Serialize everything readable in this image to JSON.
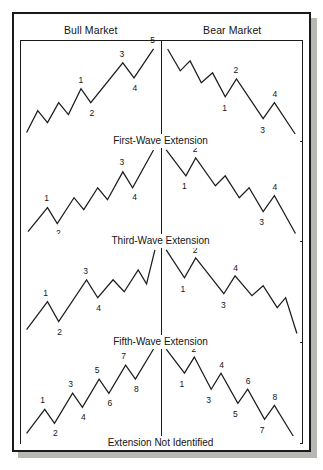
{
  "figure": {
    "columns": [
      {
        "id": "bull",
        "label": "Bull Market"
      },
      {
        "id": "bear",
        "label": "Bear Market"
      }
    ],
    "rows": [
      {
        "id": "first-wave",
        "caption": "First-Wave Extension"
      },
      {
        "id": "third-wave",
        "caption": "Third-Wave Extension"
      },
      {
        "id": "fifth-wave",
        "caption": "Fifth-Wave Extension"
      },
      {
        "id": "not-identified",
        "caption": "Extension Not Identified"
      }
    ]
  },
  "colors": {
    "line": "#1d1d1d",
    "frame": "#1a1a1a",
    "background": "#ffffff",
    "shadow": "#b9b7b4",
    "text": "#141414"
  },
  "chart_data": [
    {
      "type": "line",
      "title": "First-Wave Extension — Bull Market",
      "xlabel": "",
      "ylabel": "",
      "xlim": [
        0,
        100
      ],
      "ylim": [
        0,
        100
      ],
      "grid": false,
      "legend": null,
      "points": [
        [
          4,
          8
        ],
        [
          12,
          30
        ],
        [
          19,
          18
        ],
        [
          27,
          38
        ],
        [
          34,
          26
        ],
        [
          43,
          52
        ],
        [
          50,
          38
        ],
        [
          73,
          78
        ],
        [
          81,
          63
        ],
        [
          95,
          92
        ]
      ],
      "annotations": [
        {
          "label": "1",
          "x": 43,
          "y": 52,
          "dx": 0,
          "dy": -9
        },
        {
          "label": "2",
          "x": 50,
          "y": 38,
          "dx": 1,
          "dy": 10
        },
        {
          "label": "3",
          "x": 73,
          "y": 78,
          "dx": -1,
          "dy": -9
        },
        {
          "label": "4",
          "x": 81,
          "y": 63,
          "dx": 1,
          "dy": 10
        },
        {
          "label": "5",
          "x": 95,
          "y": 92,
          "dx": -1,
          "dy": -9
        }
      ]
    },
    {
      "type": "line",
      "title": "First-Wave Extension — Bear Market",
      "xlabel": "",
      "ylabel": "",
      "xlim": [
        0,
        100
      ],
      "ylim": [
        0,
        100
      ],
      "grid": false,
      "legend": null,
      "points": [
        [
          4,
          92
        ],
        [
          13,
          70
        ],
        [
          20,
          80
        ],
        [
          28,
          58
        ],
        [
          36,
          68
        ],
        [
          45,
          44
        ],
        [
          53,
          62
        ],
        [
          72,
          22
        ],
        [
          80,
          38
        ],
        [
          95,
          6
        ]
      ],
      "annotations": [
        {
          "label": "1",
          "x": 45,
          "y": 44,
          "dx": 0,
          "dy": 11
        },
        {
          "label": "2",
          "x": 53,
          "y": 62,
          "dx": 0,
          "dy": -9
        },
        {
          "label": "3",
          "x": 72,
          "y": 22,
          "dx": 0,
          "dy": 11
        },
        {
          "label": "4",
          "x": 80,
          "y": 38,
          "dx": 1,
          "dy": -9
        },
        {
          "label": "5",
          "x": 95,
          "y": 6,
          "dx": 3,
          "dy": 11
        }
      ]
    },
    {
      "type": "line",
      "title": "Third-Wave Extension — Bull Market",
      "xlabel": "",
      "ylabel": "",
      "xlim": [
        0,
        100
      ],
      "ylim": [
        0,
        100
      ],
      "grid": false,
      "legend": null,
      "points": [
        [
          5,
          10
        ],
        [
          19,
          34
        ],
        [
          26,
          18
        ],
        [
          38,
          44
        ],
        [
          45,
          32
        ],
        [
          55,
          54
        ],
        [
          62,
          42
        ],
        [
          73,
          70
        ],
        [
          80,
          54
        ],
        [
          95,
          92
        ]
      ],
      "annotations": [
        {
          "label": "1",
          "x": 19,
          "y": 34,
          "dx": -1,
          "dy": -9
        },
        {
          "label": "2",
          "x": 26,
          "y": 18,
          "dx": 1,
          "dy": 10
        },
        {
          "label": "3",
          "x": 73,
          "y": 70,
          "dx": -1,
          "dy": -9
        },
        {
          "label": "4",
          "x": 80,
          "y": 54,
          "dx": 2,
          "dy": 10
        },
        {
          "label": "5",
          "x": 95,
          "y": 92,
          "dx": -2,
          "dy": -9
        }
      ]
    },
    {
      "type": "line",
      "title": "Third-Wave Extension — Bear Market",
      "xlabel": "",
      "ylabel": "",
      "xlim": [
        0,
        100
      ],
      "ylim": [
        0,
        100
      ],
      "grid": false,
      "legend": null,
      "points": [
        [
          3,
          92
        ],
        [
          17,
          66
        ],
        [
          24,
          84
        ],
        [
          38,
          56
        ],
        [
          45,
          66
        ],
        [
          55,
          44
        ],
        [
          62,
          54
        ],
        [
          72,
          30
        ],
        [
          80,
          46
        ],
        [
          95,
          8
        ]
      ],
      "annotations": [
        {
          "label": "1",
          "x": 17,
          "y": 66,
          "dx": -1,
          "dy": 11
        },
        {
          "label": "2",
          "x": 24,
          "y": 84,
          "dx": 0,
          "dy": -8
        },
        {
          "label": "3",
          "x": 72,
          "y": 30,
          "dx": -1,
          "dy": 11
        },
        {
          "label": "4",
          "x": 80,
          "y": 46,
          "dx": 1,
          "dy": -8
        },
        {
          "label": "5",
          "x": 95,
          "y": 8,
          "dx": 3,
          "dy": 11
        }
      ]
    },
    {
      "type": "line",
      "title": "Fifth-Wave Extension — Bull Market",
      "xlabel": "",
      "ylabel": "",
      "xlim": [
        0,
        100
      ],
      "ylim": [
        0,
        100
      ],
      "grid": false,
      "legend": null,
      "points": [
        [
          4,
          12
        ],
        [
          19,
          40
        ],
        [
          27,
          20
        ],
        [
          47,
          62
        ],
        [
          55,
          44
        ],
        [
          66,
          62
        ],
        [
          74,
          50
        ],
        [
          84,
          72
        ],
        [
          90,
          58
        ],
        [
          96,
          92
        ]
      ],
      "annotations": [
        {
          "label": "1",
          "x": 19,
          "y": 40,
          "dx": -2,
          "dy": -9
        },
        {
          "label": "2",
          "x": 27,
          "y": 20,
          "dx": 1,
          "dy": 10
        },
        {
          "label": "3",
          "x": 47,
          "y": 62,
          "dx": -1,
          "dy": -9
        },
        {
          "label": "4",
          "x": 55,
          "y": 44,
          "dx": 1,
          "dy": 10
        },
        {
          "label": "5",
          "x": 96,
          "y": 92,
          "dx": -2,
          "dy": -9
        }
      ]
    },
    {
      "type": "line",
      "title": "Fifth-Wave Extension — Bear Market",
      "xlabel": "",
      "ylabel": "",
      "xlim": [
        0,
        100
      ],
      "ylim": [
        0,
        100
      ],
      "grid": false,
      "legend": null,
      "points": [
        [
          3,
          92
        ],
        [
          16,
          64
        ],
        [
          24,
          84
        ],
        [
          44,
          48
        ],
        [
          52,
          66
        ],
        [
          64,
          46
        ],
        [
          72,
          56
        ],
        [
          82,
          34
        ],
        [
          88,
          44
        ],
        [
          96,
          8
        ]
      ],
      "annotations": [
        {
          "label": "1",
          "x": 16,
          "y": 64,
          "dx": -1,
          "dy": 11
        },
        {
          "label": "2",
          "x": 24,
          "y": 84,
          "dx": 0,
          "dy": -8
        },
        {
          "label": "3",
          "x": 44,
          "y": 48,
          "dx": 0,
          "dy": 11
        },
        {
          "label": "4",
          "x": 52,
          "y": 66,
          "dx": 1,
          "dy": -8
        },
        {
          "label": "5",
          "x": 96,
          "y": 8,
          "dx": 3,
          "dy": 11
        }
      ]
    },
    {
      "type": "line",
      "title": "Extension Not Identified — Bull Market",
      "xlabel": "",
      "ylabel": "",
      "xlim": [
        0,
        100
      ],
      "ylim": [
        0,
        100
      ],
      "grid": false,
      "legend": null,
      "points": [
        [
          4,
          10
        ],
        [
          17,
          34
        ],
        [
          24,
          20
        ],
        [
          37,
          50
        ],
        [
          44,
          36
        ],
        [
          56,
          64
        ],
        [
          63,
          50
        ],
        [
          75,
          78
        ],
        [
          82,
          64
        ],
        [
          95,
          94
        ]
      ],
      "annotations": [
        {
          "label": "1",
          "x": 17,
          "y": 34,
          "dx": -2,
          "dy": -9
        },
        {
          "label": "2",
          "x": 24,
          "y": 20,
          "dx": 1,
          "dy": 10
        },
        {
          "label": "3",
          "x": 37,
          "y": 50,
          "dx": -2,
          "dy": -9
        },
        {
          "label": "4",
          "x": 44,
          "y": 36,
          "dx": 1,
          "dy": 10
        },
        {
          "label": "5",
          "x": 56,
          "y": 64,
          "dx": -2,
          "dy": -9
        },
        {
          "label": "6",
          "x": 63,
          "y": 50,
          "dx": 1,
          "dy": 10
        },
        {
          "label": "7",
          "x": 75,
          "y": 78,
          "dx": -2,
          "dy": -9
        },
        {
          "label": "8",
          "x": 82,
          "y": 64,
          "dx": 1,
          "dy": 10
        },
        {
          "label": "9",
          "x": 95,
          "y": 94,
          "dx": -2,
          "dy": -8
        }
      ]
    },
    {
      "type": "line",
      "title": "Extension Not Identified — Bear Market",
      "xlabel": "",
      "ylabel": "",
      "xlim": [
        0,
        100
      ],
      "ylim": [
        0,
        100
      ],
      "grid": false,
      "legend": null,
      "points": [
        [
          3,
          94
        ],
        [
          16,
          70
        ],
        [
          23,
          86
        ],
        [
          35,
          54
        ],
        [
          42,
          70
        ],
        [
          54,
          40
        ],
        [
          61,
          54
        ],
        [
          73,
          24
        ],
        [
          80,
          38
        ],
        [
          94,
          6
        ]
      ],
      "annotations": [
        {
          "label": "1",
          "x": 16,
          "y": 70,
          "dx": -2,
          "dy": 11
        },
        {
          "label": "2",
          "x": 23,
          "y": 86,
          "dx": 0,
          "dy": -8
        },
        {
          "label": "3",
          "x": 35,
          "y": 54,
          "dx": -2,
          "dy": 11
        },
        {
          "label": "4",
          "x": 42,
          "y": 70,
          "dx": 1,
          "dy": -8
        },
        {
          "label": "5",
          "x": 54,
          "y": 40,
          "dx": -2,
          "dy": 11
        },
        {
          "label": "6",
          "x": 61,
          "y": 54,
          "dx": 1,
          "dy": -8
        },
        {
          "label": "7",
          "x": 73,
          "y": 24,
          "dx": -2,
          "dy": 11
        },
        {
          "label": "8",
          "x": 80,
          "y": 38,
          "dx": 1,
          "dy": -8
        },
        {
          "label": "9",
          "x": 94,
          "y": 6,
          "dx": 3,
          "dy": 11
        }
      ]
    }
  ]
}
